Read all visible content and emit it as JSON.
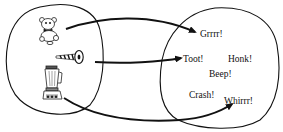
{
  "diagram": {
    "type": "function-mapping",
    "domain_set": {
      "name": "objects",
      "items": [
        {
          "id": "teddy-bear",
          "icon": "teddy-bear-icon"
        },
        {
          "id": "noisemaker-horn",
          "icon": "horn-icon"
        },
        {
          "id": "blender",
          "icon": "blender-icon"
        }
      ]
    },
    "codomain_set": {
      "name": "sounds",
      "items": [
        {
          "id": "grrrr",
          "label": "Grrrr!"
        },
        {
          "id": "toot",
          "label": "Toot!"
        },
        {
          "id": "honk",
          "label": "Honk!"
        },
        {
          "id": "beep",
          "label": "Beep!"
        },
        {
          "id": "crash",
          "label": "Crash!"
        },
        {
          "id": "whirrr",
          "label": "Whirrr!"
        }
      ]
    },
    "mappings": [
      {
        "from": "teddy-bear",
        "to": "Grrrr!"
      },
      {
        "from": "noisemaker-horn",
        "to": "Toot!"
      },
      {
        "from": "blender",
        "to": "Whirrr!"
      }
    ],
    "colors": {
      "stroke": "#111111",
      "background": "#ffffff"
    }
  }
}
